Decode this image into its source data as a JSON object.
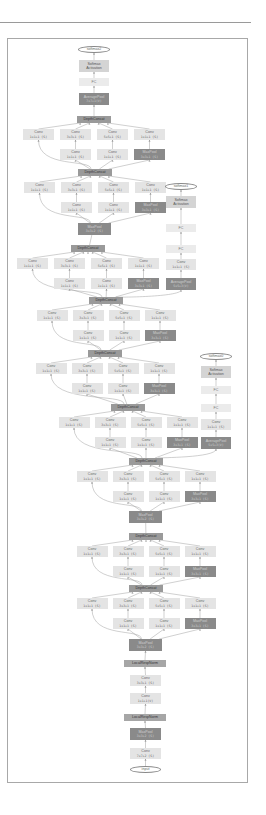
{
  "figure": {
    "colors": {
      "conv": "#e4e4e4",
      "pool": "#8a8a8a",
      "concat": "#9a9a9a",
      "lrn": "#a6a6a6",
      "fc": "#ebebeb",
      "softmax_activation": "#d4d4d4",
      "edge": "#9a9a9a",
      "frame": "#a8a8a8"
    },
    "labels": {
      "input": "input",
      "softmax0": "softmax0",
      "softmax1": "softmax1",
      "softmax2": "softmax2",
      "softmax_activation_1": "Softmax",
      "softmax_activation_2": "Activation",
      "fc": "FC",
      "depth_concat": "DepthConcat",
      "local_resp_norm": "LocalRespNorm",
      "conv": "Conv",
      "maxpool": "MaxPool",
      "avgpool": "AveragePool",
      "k1x1s": "1x1+1 (S)",
      "k3x3s": "3x3+1 (S)",
      "k5x5s": "5x5+1 (S)",
      "k1x1v": "1x1+1(V)",
      "pool3s": "3x3+1 (S)",
      "pool3s2": "3x3+2 (S)",
      "k7x7s2": "7x7+2 (S)",
      "avg5x5v": "5x5+3(V)",
      "avg7x7v": "7x7+1(V)",
      "stem_pool1": "3x3+2 (S)",
      "stem_conv3": "3x3+1 (S)"
    }
  }
}
